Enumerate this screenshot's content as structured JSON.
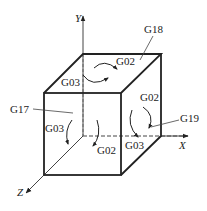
{
  "diagram": {
    "type": "cube-plane-selection",
    "axes": {
      "x": "X",
      "y": "Y",
      "z": "Z"
    },
    "planes": {
      "top": {
        "code": "G18",
        "cw": "G02",
        "ccw": "G03"
      },
      "front": {
        "code": "G17",
        "cw": "G02",
        "ccw": "G03"
      },
      "right": {
        "code": "G19",
        "cw": "G02",
        "ccw": "G03"
      }
    },
    "colors": {
      "line": "#222222",
      "background": "#ffffff"
    }
  }
}
